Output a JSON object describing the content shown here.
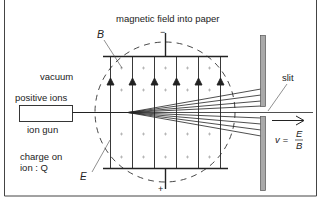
{
  "diagram": {
    "title": "magnetic field into paper",
    "labels": {
      "field_B": "B",
      "field_E": "E",
      "vacuum": "vacuum",
      "positive_ions": "positive ions",
      "ion_gun": "ion gun",
      "charge_line1": "charge on",
      "charge_line2": "ion : Q",
      "slit": "slit",
      "velocity_lhs": "v =",
      "velocity_num": "E",
      "velocity_den": "B",
      "top_terminal": "−",
      "bottom_terminal": "+"
    },
    "components": [
      "ion gun",
      "parallel plates (top negative, bottom positive)",
      "uniform electric field E (arrows up)",
      "magnetic field B into paper (crosses)",
      "dashed circular field region",
      "diverging ion beam",
      "slit plates",
      "emerging ion beam with v = E/B"
    ],
    "colors": {
      "line": "#222222",
      "slit_fill": "#a9a9a9",
      "background": "#ffffff"
    }
  }
}
